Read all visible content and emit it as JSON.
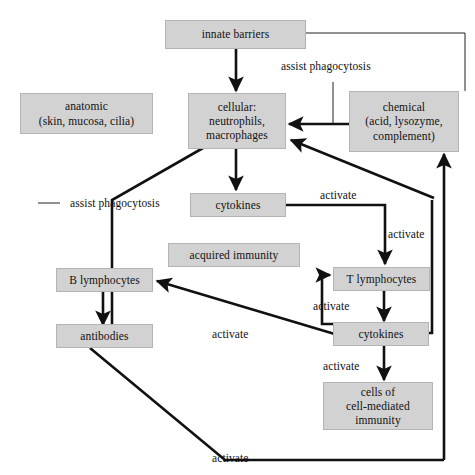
{
  "diagram": {
    "colors": {
      "box_fill": "#d2d2d2",
      "box_border": "#b4b4b4",
      "thick_line": "#111111",
      "thin_line": "#222222",
      "background": "#ffffff",
      "text": "#111111"
    },
    "nodes": [
      {
        "id": "innate-barriers",
        "label": "innate barriers"
      },
      {
        "id": "anatomic",
        "label": "anatomic\n(skin, mucosa, cilia)"
      },
      {
        "id": "cellular",
        "label": "cellular:\nneutrophils,\nmacrophages"
      },
      {
        "id": "chemical",
        "label": "chemical\n(acid, lysozyme,\ncomplement)"
      },
      {
        "id": "cytokines-innate",
        "label": "cytokines"
      },
      {
        "id": "acquired-immunity",
        "label": "acquired immunity"
      },
      {
        "id": "b-lymphocytes",
        "label": "B lymphocytes"
      },
      {
        "id": "t-lymphocytes",
        "label": "T lymphocytes"
      },
      {
        "id": "antibodies",
        "label": "antibodies"
      },
      {
        "id": "cytokines-adaptive",
        "label": "cytokines"
      },
      {
        "id": "cell-mediated",
        "label": "cells of\ncell-mediated\nimmunity"
      }
    ],
    "edge_labels": [
      {
        "id": "assist-phagocytosis-top",
        "text": "assist phagocytosis"
      },
      {
        "id": "assist-phagocytosis-left",
        "text": "assist phagocytosis"
      },
      {
        "id": "activate-cytokines-right",
        "text": "activate"
      },
      {
        "id": "activate-t-lymphocytes",
        "text": "activate"
      },
      {
        "id": "activate-t-from-cytokines",
        "text": "activate"
      },
      {
        "id": "activate-b-lymphocytes",
        "text": "activate"
      },
      {
        "id": "activate-cell-mediated",
        "text": "activate"
      },
      {
        "id": "activate-bottom",
        "text": "activate"
      }
    ]
  }
}
